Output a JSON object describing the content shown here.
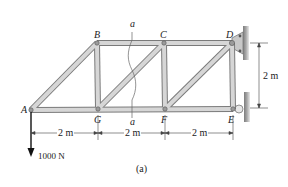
{
  "diagram": {
    "type": "truss",
    "caption": "(a)",
    "nodes": {
      "A": {
        "label": "A",
        "x": 31,
        "y": 110
      },
      "B": {
        "label": "B",
        "x": 97,
        "y": 43
      },
      "C": {
        "label": "C",
        "x": 164,
        "y": 43
      },
      "D": {
        "label": "D",
        "x": 232,
        "y": 43
      },
      "E": {
        "label": "E",
        "x": 233,
        "y": 109
      },
      "F": {
        "label": "F",
        "x": 165,
        "y": 109
      },
      "G": {
        "label": "G",
        "x": 98,
        "y": 109
      }
    },
    "members": [
      [
        "A",
        "B"
      ],
      [
        "B",
        "C"
      ],
      [
        "C",
        "D"
      ],
      [
        "A",
        "G"
      ],
      [
        "G",
        "F"
      ],
      [
        "F",
        "E"
      ],
      [
        "B",
        "G"
      ],
      [
        "C",
        "F"
      ],
      [
        "D",
        "E"
      ],
      [
        "G",
        "C"
      ],
      [
        "F",
        "D"
      ]
    ],
    "section_cut": {
      "label_top": "a",
      "label_bottom": "a"
    },
    "load": {
      "label": "1000 N",
      "node": "A",
      "direction": "down"
    },
    "dimensions": {
      "horizontal": [
        "2 m",
        "2 m",
        "2 m"
      ],
      "vertical": "2 m"
    },
    "supports": [
      {
        "node": "D",
        "type": "pin"
      },
      {
        "node": "E",
        "type": "roller"
      }
    ],
    "colors": {
      "member_fill": "#d4d4d4",
      "member_edge": "#7a7a7a",
      "wall": "#9a9a9a",
      "text": "#222222"
    }
  }
}
